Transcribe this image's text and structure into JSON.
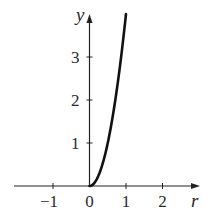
{
  "chart_data": {
    "type": "line",
    "title": "",
    "xlabel": "r",
    "ylabel": "y",
    "xlim": [
      -1.9,
      3.0
    ],
    "ylim": [
      0,
      4.0
    ],
    "grid": false,
    "legend": null,
    "x_ticks": [
      -1,
      0,
      1,
      2
    ],
    "x_tick_labels": [
      "−1",
      "0",
      "1",
      "2"
    ],
    "y_ticks": [
      1,
      2,
      3
    ],
    "y_tick_labels": [
      "1",
      "2",
      "3"
    ],
    "series": [
      {
        "name": "y = 4r^2 (r ≥ 0)",
        "x": [
          0,
          0.1,
          0.2,
          0.3,
          0.4,
          0.5,
          0.6,
          0.7,
          0.8,
          0.9,
          1.0
        ],
        "y": [
          0,
          0.04,
          0.16,
          0.36,
          0.64,
          1.0,
          1.44,
          1.96,
          2.56,
          3.24,
          4.0
        ],
        "color": "#111111"
      }
    ]
  }
}
